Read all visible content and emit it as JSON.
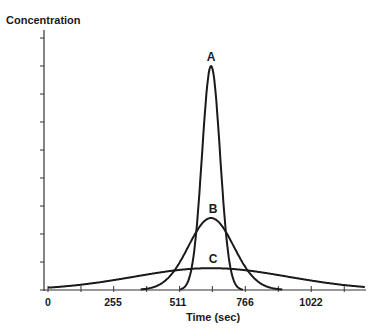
{
  "chart_data": {
    "type": "line",
    "title": "",
    "ylabel": "Concentration",
    "xlabel": "Time (sec)",
    "x_ticks": [
      0,
      255,
      511,
      766,
      1022
    ],
    "x_minor_ticks": [
      128,
      383,
      638,
      894,
      1150
    ],
    "xlim": [
      0,
      1230
    ],
    "ylim": [
      0,
      9.2
    ],
    "y_tick_count": 9,
    "y_tick_labels": [],
    "grid": false,
    "legend": "none (curves labeled inline)",
    "series": [
      {
        "name": "A",
        "shape": "gaussian",
        "center": 633,
        "peak": 8.0,
        "sigma": 35,
        "label_pos": [
          633,
          8.35
        ]
      },
      {
        "name": "B",
        "shape": "gaussian",
        "center": 633,
        "peak": 2.57,
        "sigma": 88,
        "label_pos": [
          633,
          2.9
        ]
      },
      {
        "name": "C",
        "shape": "gaussian",
        "center": 633,
        "peak": 0.78,
        "sigma": 300,
        "label_pos": [
          633,
          1.1
        ]
      }
    ],
    "annotations": [
      "A",
      "B",
      "C"
    ]
  },
  "labels": {
    "y_axis": "Concentration",
    "x_axis": "Time (sec)",
    "x_ticks": [
      "0",
      "255",
      "511",
      "766",
      "1022"
    ],
    "curve_a": "A",
    "curve_b": "B",
    "curve_c": "C"
  },
  "style": {
    "line_color": "#1a1a1a",
    "axis_color": "#333333"
  }
}
